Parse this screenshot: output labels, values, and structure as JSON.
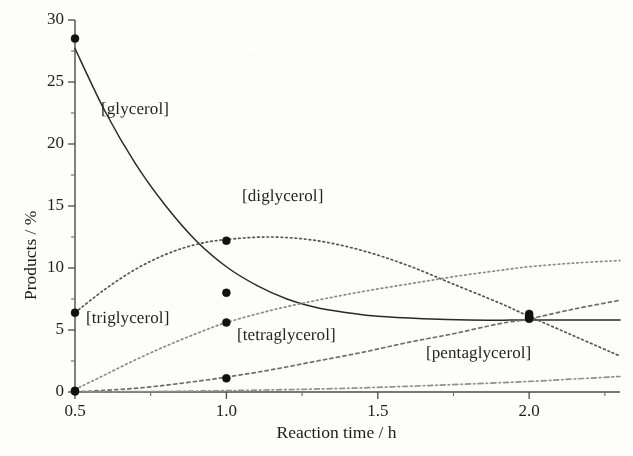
{
  "chart_data": {
    "type": "line",
    "title": "",
    "xlabel": "Reaction time / h",
    "ylabel": "Products / %",
    "xlim": [
      0.5,
      2.3
    ],
    "ylim": [
      0,
      30
    ],
    "grid": false,
    "legend_position": "inline-annotations",
    "x_ticks": [
      "0.5",
      "1.0",
      "1.5",
      "2.0"
    ],
    "x_tick_values": [
      0.5,
      1.0,
      1.5,
      2.0
    ],
    "x_minor_tick_values": [
      0.75,
      1.25,
      1.75,
      2.25
    ],
    "y_ticks": [
      "0",
      "5",
      "10",
      "15",
      "20",
      "25",
      "30"
    ],
    "y_tick_values": [
      0,
      5,
      10,
      15,
      20,
      25,
      30
    ],
    "y_minor_tick_values": [
      2.5,
      7.5,
      12.5,
      17.5,
      22.5,
      27.5
    ],
    "series": [
      {
        "name": "[glycerol]",
        "style": "solid",
        "color": "#2a2a2a",
        "points": [
          {
            "x": 0.5,
            "y": 28.5
          },
          {
            "x": 1.0,
            "y": 8.0
          },
          {
            "x": 2.0,
            "y": 6.0
          }
        ],
        "curve": [
          {
            "x": 0.5,
            "y": 27.7
          },
          {
            "x": 0.6,
            "y": 22.6
          },
          {
            "x": 0.7,
            "y": 18.4
          },
          {
            "x": 0.8,
            "y": 15.0
          },
          {
            "x": 0.9,
            "y": 12.2
          },
          {
            "x": 1.0,
            "y": 10.1
          },
          {
            "x": 1.1,
            "y": 8.6
          },
          {
            "x": 1.2,
            "y": 7.5
          },
          {
            "x": 1.3,
            "y": 6.8
          },
          {
            "x": 1.4,
            "y": 6.4
          },
          {
            "x": 1.5,
            "y": 6.1
          },
          {
            "x": 1.65,
            "y": 5.9
          },
          {
            "x": 1.8,
            "y": 5.8
          },
          {
            "x": 2.0,
            "y": 5.8
          },
          {
            "x": 2.3,
            "y": 5.8
          }
        ]
      },
      {
        "name": "[diglycerol]",
        "style": "dotted",
        "color": "#555555",
        "points": [
          {
            "x": 0.5,
            "y": 6.4
          },
          {
            "x": 1.0,
            "y": 12.2
          },
          {
            "x": 2.0,
            "y": 6.1
          }
        ],
        "curve": [
          {
            "x": 0.5,
            "y": 6.4
          },
          {
            "x": 0.6,
            "y": 8.3
          },
          {
            "x": 0.7,
            "y": 9.9
          },
          {
            "x": 0.8,
            "y": 11.1
          },
          {
            "x": 0.9,
            "y": 11.9
          },
          {
            "x": 1.0,
            "y": 12.3
          },
          {
            "x": 1.15,
            "y": 12.5
          },
          {
            "x": 1.3,
            "y": 12.2
          },
          {
            "x": 1.45,
            "y": 11.4
          },
          {
            "x": 1.6,
            "y": 10.2
          },
          {
            "x": 1.75,
            "y": 8.7
          },
          {
            "x": 1.9,
            "y": 7.2
          },
          {
            "x": 2.0,
            "y": 6.1
          },
          {
            "x": 2.15,
            "y": 4.5
          },
          {
            "x": 2.3,
            "y": 2.9
          }
        ]
      },
      {
        "name": "[triglycerol]",
        "style": "dotted",
        "color": "#8a8a8a",
        "points": [
          {
            "x": 0.5,
            "y": 0.1
          },
          {
            "x": 1.0,
            "y": 5.6
          },
          {
            "x": 2.0,
            "y": 6.3
          }
        ],
        "curve": [
          {
            "x": 0.5,
            "y": 0.2
          },
          {
            "x": 0.6,
            "y": 1.4
          },
          {
            "x": 0.7,
            "y": 2.6
          },
          {
            "x": 0.8,
            "y": 3.7
          },
          {
            "x": 0.9,
            "y": 4.7
          },
          {
            "x": 1.0,
            "y": 5.6
          },
          {
            "x": 1.15,
            "y": 6.6
          },
          {
            "x": 1.3,
            "y": 7.4
          },
          {
            "x": 1.45,
            "y": 8.1
          },
          {
            "x": 1.6,
            "y": 8.7
          },
          {
            "x": 1.75,
            "y": 9.3
          },
          {
            "x": 1.9,
            "y": 9.8
          },
          {
            "x": 2.0,
            "y": 10.1
          },
          {
            "x": 2.15,
            "y": 10.4
          },
          {
            "x": 2.3,
            "y": 10.6
          }
        ]
      },
      {
        "name": "[tetraglycerol]",
        "style": "dashed",
        "color": "#6e6e6e",
        "points": [
          {
            "x": 1.0,
            "y": 1.1
          },
          {
            "x": 2.0,
            "y": 5.9
          }
        ],
        "curve": [
          {
            "x": 0.5,
            "y": 0.0
          },
          {
            "x": 0.7,
            "y": 0.3
          },
          {
            "x": 0.85,
            "y": 0.7
          },
          {
            "x": 1.0,
            "y": 1.2
          },
          {
            "x": 1.15,
            "y": 1.8
          },
          {
            "x": 1.3,
            "y": 2.5
          },
          {
            "x": 1.45,
            "y": 3.2
          },
          {
            "x": 1.6,
            "y": 4.0
          },
          {
            "x": 1.75,
            "y": 4.7
          },
          {
            "x": 1.9,
            "y": 5.5
          },
          {
            "x": 2.0,
            "y": 5.9
          },
          {
            "x": 2.15,
            "y": 6.7
          },
          {
            "x": 2.3,
            "y": 7.4
          }
        ]
      },
      {
        "name": "[pentaglycerol]",
        "style": "dashdot",
        "color": "#909090",
        "points": [
          {
            "x": 0.5,
            "y": 0.05
          }
        ],
        "curve": [
          {
            "x": 0.5,
            "y": 0.0
          },
          {
            "x": 0.8,
            "y": 0.05
          },
          {
            "x": 1.1,
            "y": 0.15
          },
          {
            "x": 1.4,
            "y": 0.3
          },
          {
            "x": 1.7,
            "y": 0.55
          },
          {
            "x": 2.0,
            "y": 0.85
          },
          {
            "x": 2.15,
            "y": 1.05
          },
          {
            "x": 2.3,
            "y": 1.25
          }
        ]
      }
    ],
    "annotations": [
      {
        "text": "[glycerol]",
        "x_px": 101,
        "y_px": 99
      },
      {
        "text": "[diglycerol]",
        "x_px": 242,
        "y_px": 186
      },
      {
        "text": "[triglycerol]",
        "x_px": 86,
        "y_px": 308
      },
      {
        "text": "[tetraglycerol]",
        "x_px": 237,
        "y_px": 325
      },
      {
        "text": "[pentaglycerol]",
        "x_px": 426,
        "y_px": 343
      }
    ]
  }
}
